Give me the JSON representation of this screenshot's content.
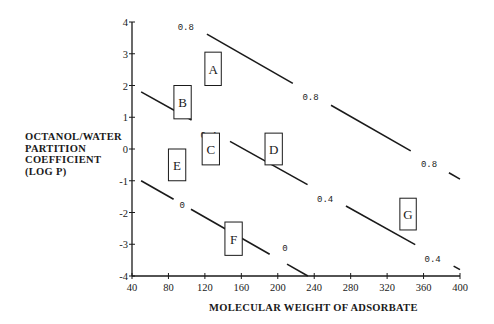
{
  "chart_data": {
    "type": "line",
    "title": "",
    "xlabel": "MOLECULAR WEIGHT OF ADSORBATE",
    "ylabel_lines": [
      "OCTANOL/WATER",
      "PARTITION",
      "COEFFICIENT",
      "(LOG P)"
    ],
    "xlim": [
      40,
      400
    ],
    "ylim": [
      -4,
      4
    ],
    "x_ticks": [
      40,
      80,
      120,
      160,
      200,
      240,
      280,
      320,
      360,
      400
    ],
    "y_ticks": [
      4,
      3,
      2,
      1,
      0,
      -1,
      -2,
      -3,
      -4
    ],
    "grid": false,
    "legend": null,
    "series": [
      {
        "name": "0.8",
        "points": [
          [
            93,
            4.1
          ],
          [
            400,
            -0.95
          ]
        ],
        "labels": [
          {
            "text": "0.8",
            "x": 99,
            "y": 3.85
          },
          {
            "text": "0.8",
            "x": 236,
            "y": 1.65
          },
          {
            "text": "0.8",
            "x": 366,
            "y": -0.45
          }
        ]
      },
      {
        "name": "0.4",
        "points": [
          [
            50,
            1.8
          ],
          [
            400,
            -3.8
          ]
        ],
        "labels": [
          {
            "text": "0.4",
            "x": 124,
            "y": 0.45
          },
          {
            "text": "0.4",
            "x": 252,
            "y": -1.55
          },
          {
            "text": "0.4",
            "x": 370,
            "y": -3.45
          }
        ]
      },
      {
        "name": "0",
        "points": [
          [
            50,
            -1.0
          ],
          [
            233,
            -4.0
          ]
        ],
        "labels": [
          {
            "text": "0",
            "x": 95,
            "y": -1.75
          },
          {
            "text": "0",
            "x": 208,
            "y": -3.1
          }
        ]
      }
    ],
    "regions": [
      {
        "label": "A",
        "x": [
          120,
          138
        ],
        "y": [
          2.0,
          3.05
        ]
      },
      {
        "label": "B",
        "x": [
          86,
          105
        ],
        "y": [
          0.95,
          2.0
        ]
      },
      {
        "label": "C",
        "x": [
          117,
          136
        ],
        "y": [
          -0.5,
          0.5
        ]
      },
      {
        "label": "D",
        "x": [
          186,
          205
        ],
        "y": [
          -0.5,
          0.5
        ]
      },
      {
        "label": "E",
        "x": [
          80,
          99
        ],
        "y": [
          -1.0,
          0.0
        ]
      },
      {
        "label": "F",
        "x": [
          142,
          161
        ],
        "y": [
          -3.35,
          -2.3
        ]
      },
      {
        "label": "G",
        "x": [
          334,
          352
        ],
        "y": [
          -2.55,
          -1.55
        ]
      }
    ]
  },
  "colors": {
    "ink": "#1a1a1a",
    "background": "#ffffff"
  }
}
